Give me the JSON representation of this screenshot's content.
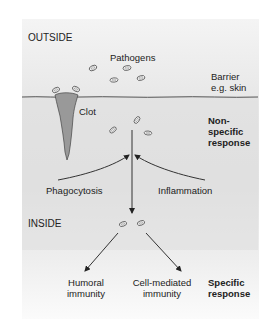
{
  "diagram": {
    "regions": {
      "outside": "OUTSIDE",
      "inside": "INSIDE"
    },
    "labels": {
      "pathogens": "Pathogens",
      "barrier_line1": "Barrier",
      "barrier_line2": "e.g. skin",
      "clot": "Clot",
      "phagocytosis": "Phagocytosis",
      "inflammation": "Inflammation",
      "humoral_line1": "Humoral",
      "humoral_line2": "immunity",
      "cellmediated_line1": "Cell-mediated",
      "cellmediated_line2": "immunity"
    },
    "responses": {
      "nonspecific_line1": "Non-",
      "nonspecific_line2": "specific",
      "nonspecific_line3": "response",
      "specific_line1": "Specific",
      "specific_line2": "response"
    },
    "colors": {
      "panel_top": "#f4f4f4",
      "panel_mid": "#e2e2e2",
      "clot_fill": "#999999",
      "line": "#333333"
    }
  }
}
